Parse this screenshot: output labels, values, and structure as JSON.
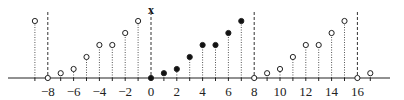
{
  "chart_data": {
    "type": "stem",
    "title": "",
    "ylabel": "x",
    "xlabel": "",
    "period": 8,
    "x_ticks": [
      -8,
      -6,
      -4,
      -2,
      0,
      2,
      4,
      6,
      8,
      10,
      12,
      14,
      16
    ],
    "tick_labels": [
      "−8",
      "−6",
      "−4",
      "−2",
      "0",
      "2",
      "4",
      "6",
      "8",
      "10",
      "12",
      "14",
      "16"
    ],
    "dashed_lines_at": [
      -8,
      0,
      8,
      16
    ],
    "points": [
      {
        "n": -9,
        "value": 4.75,
        "filled": false
      },
      {
        "n": -8,
        "value": 0,
        "filled": false
      },
      {
        "n": -7,
        "value": 0.4,
        "filled": false
      },
      {
        "n": -6,
        "value": 0.75,
        "filled": false
      },
      {
        "n": -5,
        "value": 1.75,
        "filled": false
      },
      {
        "n": -4,
        "value": 2.75,
        "filled": false
      },
      {
        "n": -3,
        "value": 2.75,
        "filled": false
      },
      {
        "n": -2,
        "value": 3.75,
        "filled": false
      },
      {
        "n": -1,
        "value": 4.75,
        "filled": false
      },
      {
        "n": 0,
        "value": 0,
        "filled": true
      },
      {
        "n": 1,
        "value": 0.4,
        "filled": true
      },
      {
        "n": 2,
        "value": 0.75,
        "filled": true
      },
      {
        "n": 3,
        "value": 1.75,
        "filled": true
      },
      {
        "n": 4,
        "value": 2.75,
        "filled": true
      },
      {
        "n": 5,
        "value": 2.75,
        "filled": true
      },
      {
        "n": 6,
        "value": 3.75,
        "filled": true
      },
      {
        "n": 7,
        "value": 4.75,
        "filled": true
      },
      {
        "n": 8,
        "value": 0,
        "filled": false
      },
      {
        "n": 9,
        "value": 0.4,
        "filled": false
      },
      {
        "n": 10,
        "value": 0.75,
        "filled": false
      },
      {
        "n": 11,
        "value": 1.75,
        "filled": false
      },
      {
        "n": 12,
        "value": 2.75,
        "filled": false
      },
      {
        "n": 13,
        "value": 2.75,
        "filled": false
      },
      {
        "n": 14,
        "value": 3.75,
        "filled": false
      },
      {
        "n": 15,
        "value": 4.75,
        "filled": false
      },
      {
        "n": 16,
        "value": 0,
        "filled": false
      },
      {
        "n": 17,
        "value": 0.4,
        "filled": false
      }
    ]
  }
}
